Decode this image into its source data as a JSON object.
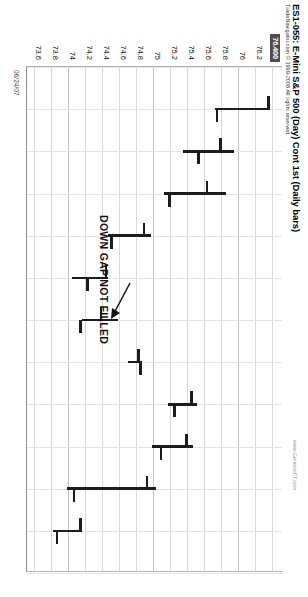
{
  "chart_data": {
    "type": "ohlc",
    "title": "ES1-055: E-Mini S&P 500 (Day) Cont 1st (Daily bars)",
    "subtitle": "TradeNavigator.com © 1999-2008 All rights reserved",
    "watermark": "www.GenesisFT.com",
    "orientation": "rotated-90",
    "xlabel": "",
    "ylabel": "",
    "ylim": [
      73.5,
      76.5
    ],
    "grid": true,
    "legend": "none",
    "date_labels": [
      "06/24/07"
    ],
    "current_price_tag": "76.400",
    "ytick_labels": [
      "76.400",
      "76.2",
      "76",
      "75.8",
      "75.6",
      "75.4",
      "75.2",
      "75",
      "74.8",
      "74.6",
      "74.4",
      "74.2",
      "74",
      "73.8",
      "73.6"
    ],
    "ytick_values": [
      76.4,
      76.2,
      76.0,
      75.8,
      75.6,
      75.4,
      75.2,
      75.0,
      74.8,
      74.6,
      74.4,
      74.2,
      74.0,
      73.8,
      73.6
    ],
    "bars": [
      {
        "index": 1,
        "open": 76.34,
        "high": 76.36,
        "low": 75.72,
        "close": 75.74
      },
      {
        "index": 2,
        "open": 75.78,
        "high": 75.94,
        "low": 75.34,
        "close": 75.52
      },
      {
        "index": 3,
        "open": 75.62,
        "high": 75.84,
        "low": 75.12,
        "close": 75.18
      },
      {
        "index": 4,
        "open": 74.88,
        "high": 74.96,
        "low": 74.46,
        "close": 74.5
      },
      {
        "index": 5,
        "open": 74.44,
        "high": 74.46,
        "low": 74.04,
        "close": 74.22
      },
      {
        "index": 6,
        "open": 74.38,
        "high": 74.58,
        "low": 74.16,
        "close": 74.14
      },
      {
        "index": 7,
        "open": 74.82,
        "high": 74.86,
        "low": 74.7,
        "close": 74.84
      },
      {
        "index": 8,
        "open": 75.44,
        "high": 75.5,
        "low": 75.16,
        "close": 75.24
      },
      {
        "index": 9,
        "open": 75.38,
        "high": 75.46,
        "low": 74.98,
        "close": 75.08
      },
      {
        "index": 10,
        "open": 74.92,
        "high": 75.02,
        "low": 73.98,
        "close": 74.06
      },
      {
        "index": 11,
        "open": 74.14,
        "high": 74.16,
        "low": 73.82,
        "close": 73.86
      }
    ],
    "annotations": [
      {
        "text": "DOWN GAP NOT FILLED",
        "type": "text-with-arrow",
        "arrow": "points-to-gap"
      }
    ]
  }
}
